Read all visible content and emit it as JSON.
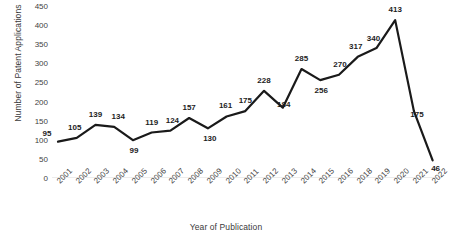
{
  "chart_data": {
    "type": "line",
    "title": "",
    "xlabel": "Year of Publication",
    "ylabel": "Number of Patent Applications",
    "categories": [
      "2001",
      "2002",
      "2003",
      "2004",
      "2005",
      "2006",
      "2007",
      "2008",
      "2009",
      "2010",
      "2011",
      "2012",
      "2013",
      "2014",
      "2015",
      "2016",
      "2018",
      "2019",
      "2020",
      "2021",
      "2022"
    ],
    "values": [
      95,
      105,
      139,
      134,
      99,
      119,
      124,
      157,
      130,
      161,
      175,
      228,
      184,
      285,
      256,
      270,
      317,
      340,
      413,
      175,
      46
    ],
    "data_labels": [
      "95",
      "105",
      "139",
      "134",
      "99",
      "119",
      "124",
      "157",
      "130",
      "161",
      "175",
      "228",
      "184",
      "285",
      "256",
      "270",
      "317",
      "340",
      "413",
      "175",
      "46"
    ],
    "ylim": [
      0,
      450
    ],
    "yticks": [
      0,
      50,
      100,
      150,
      200,
      250,
      300,
      350,
      400,
      450
    ],
    "ytick_labels": [
      "0",
      "50",
      "100",
      "150",
      "200",
      "250",
      "300",
      "350",
      "400",
      "450"
    ],
    "grid": false,
    "legend": false,
    "line_color": "#1a1a1a",
    "line_width": 2.2,
    "label_color": "#1d1d1d",
    "axis_color": "#d9d9d9",
    "background": "#ffffff"
  }
}
